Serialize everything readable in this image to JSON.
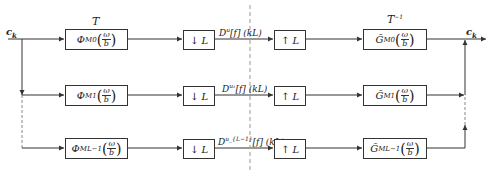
{
  "input": {
    "label": "c",
    "sub": "k"
  },
  "output": {
    "label": "c",
    "sub": "k"
  },
  "transform_label": "T",
  "inverse_transform_label": "T",
  "inverse_sup": "−1",
  "frac": {
    "num": "ω",
    "den": "b"
  },
  "rows": [
    {
      "analysis": {
        "symbol": "Φ",
        "sub": "M0"
      },
      "down": "L",
      "coef": {
        "base": "D",
        "sup": "u",
        "tail": "[f] (kL)"
      },
      "up": "L",
      "synthesis": {
        "symbol": "G̃",
        "sub": "M0"
      }
    },
    {
      "analysis": {
        "symbol": "Φ",
        "sub": "M1"
      },
      "down": "L",
      "coef": {
        "base": "D",
        "sup": "u₁",
        "tail": "[f] (kL)"
      },
      "up": "L",
      "synthesis": {
        "symbol": "G̃",
        "sub": "M1"
      }
    },
    {
      "analysis": {
        "symbol": "Φ",
        "sub": "ML−1"
      },
      "down": "L",
      "coef": {
        "base": "D",
        "sup": "u_{L−1}",
        "tail": "[f] (kL)"
      },
      "up": "L",
      "synthesis": {
        "symbol": "G̃",
        "sub": "ML−1"
      }
    }
  ],
  "colors": {
    "line": "#333333",
    "dashed": "#999999"
  }
}
